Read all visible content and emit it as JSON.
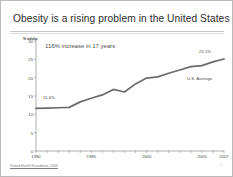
{
  "slide": {
    "title": "Obesity is a rising problem in the United States",
    "footer_source": "United Health Foundation, 2008",
    "page_number": "7"
  },
  "annotations": {
    "increase_note": "116% increase in 17 years",
    "start_label": "11.6%",
    "end_label": "25.1%",
    "series_label": "U.S. Average"
  },
  "colors": {
    "line": "#6b6b6b",
    "axis": "#8a8a8a",
    "text": "#4a4a4a",
    "title": "#2b2b2b",
    "rule": "#c6c6c6",
    "background": "#ffffff"
  },
  "chart_data": {
    "type": "line",
    "title": "",
    "xlabel": "",
    "ylabel": "% adults",
    "ylim": [
      0,
      30
    ],
    "yticks": [
      0,
      5,
      10,
      15,
      20,
      25,
      30
    ],
    "xlim": [
      1990,
      2007
    ],
    "xticks": [
      1990,
      1995,
      2000,
      2005,
      2007
    ],
    "xtick_labels": [
      "1990",
      "1995",
      "2000",
      "2005",
      "2007"
    ],
    "grid": false,
    "legend": "none",
    "x": [
      1990,
      1991,
      1992,
      1993,
      1994,
      1995,
      1996,
      1997,
      1998,
      1999,
      2000,
      2001,
      2002,
      2003,
      2004,
      2005,
      2006,
      2007
    ],
    "series": [
      {
        "name": "U.S. Average",
        "values": [
          11.6,
          11.7,
          11.8,
          11.9,
          13.4,
          14.4,
          15.3,
          16.8,
          16.1,
          18.3,
          19.9,
          20.2,
          21.2,
          22.1,
          23.0,
          23.3,
          24.3,
          25.1
        ]
      }
    ]
  }
}
